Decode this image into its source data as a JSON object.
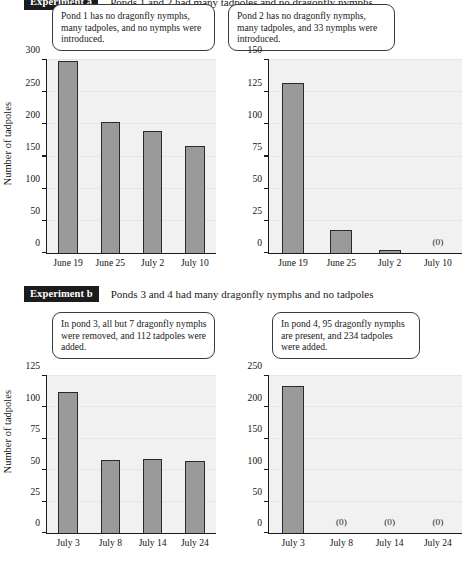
{
  "experiments": [
    {
      "badge": "Experiment a",
      "caption": "Ponds 1 and 2 had many tadpoles and no dragonfly nymphs"
    },
    {
      "badge": "Experiment b",
      "caption": "Ponds 3 and 4 had many dragonfly nymphs and no tadpoles"
    }
  ],
  "callouts": [
    {
      "text": "Pond 1 has no dragonfly nymphs, many tadpoles, and no nymphs were introduced."
    },
    {
      "text": "Pond 2 has no dragonfly nymphs, many tadpoles, and 33 nymphs were introduced."
    },
    {
      "text": "In pond 3, all but 7 dragonfly nymphs were removed, and 112 tadpoles were added."
    },
    {
      "text": "In pond 4, 95 dragonfly nymphs are present, and 234 tadpoles were added."
    }
  ],
  "chart_data": [
    {
      "id": "pond-1",
      "type": "bar",
      "title": "",
      "xlabel": "",
      "ylabel": "Number of tadpoles",
      "categories": [
        "June 19",
        "June 25",
        "July 2",
        "July 10"
      ],
      "values": [
        298,
        203,
        190,
        167
      ],
      "value_notes": [
        "",
        "",
        "",
        ""
      ],
      "ylim": [
        0,
        300
      ],
      "yticks": [
        0,
        50,
        100,
        150,
        200,
        250,
        300
      ],
      "grid": true,
      "legend": "none",
      "bar_color": "#9a9a9a",
      "bar_edge_color": "#2a2a2a",
      "plot_bg": "#f1f1f1"
    },
    {
      "id": "pond-2",
      "type": "bar",
      "title": "",
      "xlabel": "",
      "ylabel": "",
      "categories": [
        "June 19",
        "June 25",
        "July 2",
        "July 10"
      ],
      "values": [
        132,
        18,
        2,
        0
      ],
      "value_notes": [
        "",
        "",
        "",
        "(0)"
      ],
      "ylim": [
        0,
        150
      ],
      "yticks": [
        0,
        25,
        50,
        75,
        100,
        125,
        150
      ],
      "grid": true,
      "legend": "none",
      "bar_color": "#9a9a9a",
      "bar_edge_color": "#2a2a2a",
      "plot_bg": "#f1f1f1"
    },
    {
      "id": "pond-3",
      "type": "bar",
      "title": "",
      "xlabel": "",
      "ylabel": "Number of tadpoles",
      "categories": [
        "July 3",
        "July 8",
        "July 14",
        "July 24"
      ],
      "values": [
        112,
        58,
        59,
        57
      ],
      "value_notes": [
        "",
        "",
        "",
        ""
      ],
      "ylim": [
        0,
        125
      ],
      "yticks": [
        0,
        25,
        50,
        75,
        100,
        125
      ],
      "grid": true,
      "legend": "none",
      "bar_color": "#9a9a9a",
      "bar_edge_color": "#2a2a2a",
      "plot_bg": "#f1f1f1"
    },
    {
      "id": "pond-4",
      "type": "bar",
      "title": "",
      "xlabel": "",
      "ylabel": "",
      "categories": [
        "July 3",
        "July 8",
        "July 14",
        "July 24"
      ],
      "values": [
        234,
        0,
        0,
        0
      ],
      "value_notes": [
        "",
        "(0)",
        "(0)",
        "(0)"
      ],
      "ylim": [
        0,
        250
      ],
      "yticks": [
        0,
        50,
        100,
        150,
        200,
        250
      ],
      "grid": true,
      "legend": "none",
      "bar_color": "#9a9a9a",
      "bar_edge_color": "#2a2a2a",
      "plot_bg": "#f1f1f1"
    }
  ]
}
